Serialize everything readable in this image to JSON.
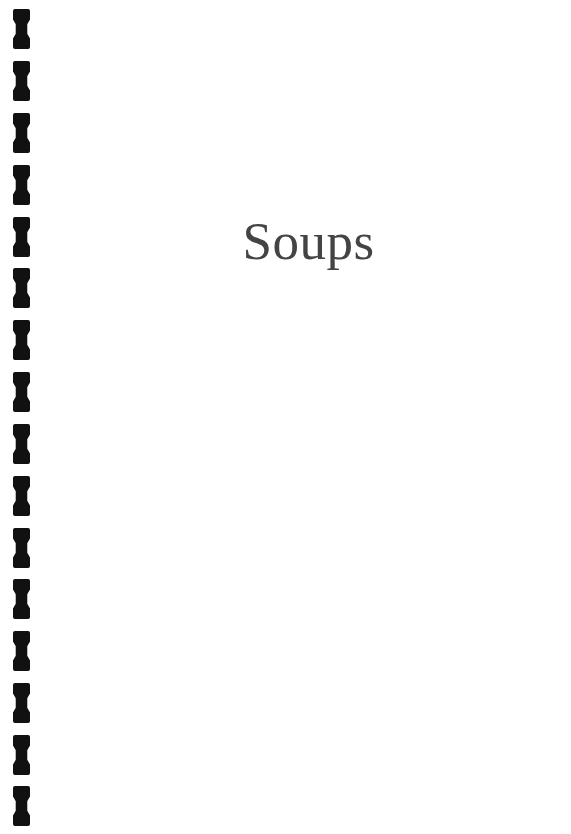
{
  "page": {
    "kind": "book-section-divider-page",
    "background_color": "#ffffff",
    "width": 571,
    "height": 834
  },
  "title": {
    "text": "Soups",
    "color": "#444444"
  },
  "binding": {
    "icon": "spiral-binding-hole-icon",
    "color": "#111111",
    "hole_count": 16,
    "holes": [
      {
        "index": 1,
        "top": 9
      },
      {
        "index": 2,
        "top": 61
      },
      {
        "index": 3,
        "top": 113
      },
      {
        "index": 4,
        "top": 165
      },
      {
        "index": 5,
        "top": 217
      },
      {
        "index": 6,
        "top": 268
      },
      {
        "index": 7,
        "top": 320
      },
      {
        "index": 8,
        "top": 372
      },
      {
        "index": 9,
        "top": 424
      },
      {
        "index": 10,
        "top": 476
      },
      {
        "index": 11,
        "top": 528
      },
      {
        "index": 12,
        "top": 579
      },
      {
        "index": 13,
        "top": 631
      },
      {
        "index": 14,
        "top": 683
      },
      {
        "index": 15,
        "top": 735
      },
      {
        "index": 16,
        "top": 786
      }
    ]
  }
}
